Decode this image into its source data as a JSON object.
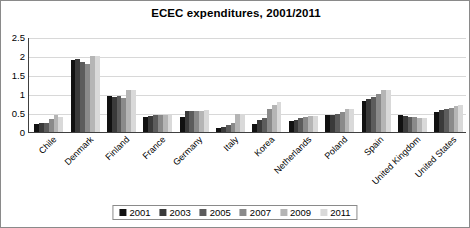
{
  "chart_data": {
    "type": "bar",
    "title": "ECEC expenditures, 2001/2011",
    "xlabel": "",
    "ylabel": "",
    "ylim": [
      0,
      2.5
    ],
    "yticks": [
      "0",
      "0.5",
      "1",
      "1.5",
      "2",
      "2.5"
    ],
    "ytick_values": [
      0,
      0.5,
      1,
      1.5,
      2,
      2.5
    ],
    "grid": "horizontal",
    "legend_position": "bottom-center",
    "categories": [
      "Chile",
      "Denmark",
      "Finland",
      "France",
      "Germany",
      "Italy",
      "Korea",
      "Netherlands",
      "Poland",
      "Spain",
      "United Kingdom",
      "United States"
    ],
    "series": [
      {
        "name": "2001",
        "color": "#111111",
        "values": [
          0.22,
          1.9,
          0.95,
          0.4,
          0.4,
          0.1,
          0.21,
          0.3,
          0.45,
          0.82,
          0.45,
          0.52
        ]
      },
      {
        "name": "2003",
        "color": "#3a3a3a",
        "values": [
          0.24,
          1.93,
          0.93,
          0.41,
          0.56,
          0.14,
          0.32,
          0.31,
          0.46,
          0.86,
          0.42,
          0.58
        ]
      },
      {
        "name": "2005",
        "color": "#5c5c5c",
        "values": [
          0.25,
          1.85,
          0.95,
          0.44,
          0.55,
          0.18,
          0.37,
          0.36,
          0.48,
          0.92,
          0.4,
          0.6
        ]
      },
      {
        "name": "2007",
        "color": "#8a8a8a",
        "values": [
          0.33,
          1.78,
          0.9,
          0.44,
          0.55,
          0.24,
          0.6,
          0.39,
          0.52,
          1.0,
          0.4,
          0.62
        ]
      },
      {
        "name": "2009",
        "color": "#b5b5b5",
        "values": [
          0.44,
          2.0,
          1.1,
          0.45,
          0.56,
          0.47,
          0.72,
          0.43,
          0.6,
          1.1,
          0.38,
          0.68
        ]
      },
      {
        "name": "2011",
        "color": "#d9d9d9",
        "values": [
          0.4,
          2.0,
          1.1,
          0.45,
          0.58,
          0.47,
          0.8,
          0.42,
          0.61,
          1.1,
          0.38,
          0.7
        ]
      }
    ]
  }
}
